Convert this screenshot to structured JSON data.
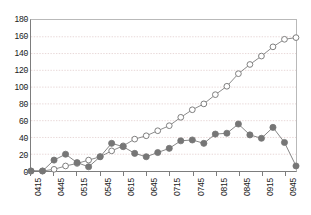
{
  "chart_data": {
    "type": "line",
    "title": "",
    "subtitle": "",
    "xlabel": "",
    "ylabel": "",
    "ylim": [
      0,
      180
    ],
    "ytick_step": 20,
    "yticks": [
      0,
      20,
      40,
      60,
      80,
      100,
      120,
      140,
      160,
      180
    ],
    "grid": "horizontal-dotted",
    "legend": "none",
    "x_tick_interval_minutes": 30,
    "x_point_interval_minutes": 15,
    "x_tick_labels": [
      "0415",
      "0445",
      "0515",
      "0545",
      "0615",
      "0645",
      "0715",
      "0745",
      "0815",
      "0845",
      "0915",
      "0945"
    ],
    "x": [
      "0415",
      "0430",
      "0445",
      "0500",
      "0515",
      "0530",
      "0545",
      "0600",
      "0615",
      "0630",
      "0645",
      "0700",
      "0715",
      "0730",
      "0745",
      "0800",
      "0815",
      "0830",
      "0845",
      "0900",
      "0915",
      "0930",
      "0945",
      "1000"
    ],
    "series": [
      {
        "name": "open-circle-series",
        "marker": "open-circle",
        "color": "#7d7d7d",
        "fill": "#ffffff",
        "values": [
          0,
          0,
          2,
          6,
          9,
          13,
          17,
          24,
          30,
          38,
          42,
          48,
          54,
          64,
          73,
          80,
          91,
          101,
          116,
          127,
          137,
          148,
          157,
          159
        ]
      },
      {
        "name": "filled-circle-series",
        "marker": "filled-circle",
        "color": "#767676",
        "fill": "#767676",
        "values": [
          0,
          0,
          13,
          20,
          10,
          5,
          17,
          33,
          29,
          21,
          17,
          22,
          27,
          36,
          37,
          33,
          44,
          45,
          56,
          43,
          39,
          52,
          34,
          6
        ]
      }
    ],
    "colors": {
      "axis": "#7d7d7d",
      "grid": "#e8d8d8",
      "text": "#1a1a1a",
      "series_open": "#7d7d7d",
      "series_filled": "#767676",
      "background": "#ffffff"
    }
  }
}
